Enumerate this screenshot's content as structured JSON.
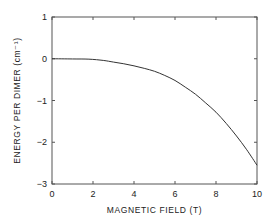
{
  "chart_data": {
    "type": "line",
    "title": "",
    "xlabel": "MAGNETIC FIELD (T)",
    "ylabel": "ENERGY PER DIMER (cm⁻¹)",
    "xlim": [
      0,
      10
    ],
    "ylim": [
      -3,
      1
    ],
    "xticks": [
      0,
      2,
      4,
      6,
      8,
      10
    ],
    "yticks": [
      1,
      0,
      -1,
      -2,
      -3
    ],
    "grid": false,
    "legend": null,
    "series": [
      {
        "name": "energy",
        "x": [
          0,
          1,
          1.8,
          2.5,
          3,
          3.5,
          4,
          4.5,
          5,
          5.5,
          6,
          6.5,
          7,
          7.5,
          8,
          8.5,
          9,
          9.5,
          10
        ],
        "y": [
          0,
          -0.005,
          -0.01,
          -0.04,
          -0.08,
          -0.12,
          -0.17,
          -0.23,
          -0.3,
          -0.4,
          -0.52,
          -0.68,
          -0.85,
          -1.06,
          -1.28,
          -1.55,
          -1.85,
          -2.18,
          -2.55
        ]
      }
    ]
  },
  "axes": {
    "x_title": "MAGNETIC FIELD (T)",
    "y_title": "ENERGY PER DIMER (cm⁻¹)",
    "x_tick_labels": [
      "0",
      "2",
      "4",
      "6",
      "8",
      "10"
    ],
    "y_tick_labels": [
      "1",
      "0",
      "−1",
      "−2",
      "−3"
    ]
  },
  "colors": {
    "line": "#333333",
    "frame": "#555555",
    "background": "#ffffff"
  }
}
